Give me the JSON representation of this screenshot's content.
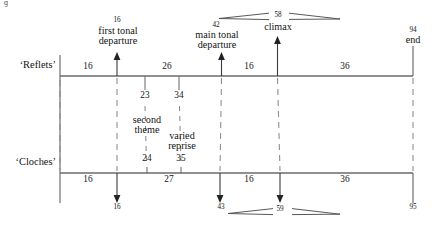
{
  "figure": {
    "type": "timeline-comparison-diagram",
    "tracks": [
      {
        "id": "reflets",
        "label": "‘Reflets’",
        "spans": [
          "16",
          "26",
          "16",
          "36"
        ],
        "ticks": [
          "23",
          "34"
        ],
        "start": "",
        "end": "94",
        "end_label": "end"
      },
      {
        "id": "cloches",
        "label": "‘Cloches’",
        "spans": [
          "16",
          "27",
          "16",
          "36"
        ],
        "ticks": [
          "24",
          "35"
        ],
        "end": "95"
      }
    ],
    "events": [
      {
        "id": "first-tonal-departure",
        "top_number": "16",
        "name": "first tonal\ndeparture",
        "bottom_number": "16"
      },
      {
        "id": "main-tonal-departure",
        "top_number": "42",
        "name": "main tonal\ndeparture",
        "bottom_number": "43"
      },
      {
        "id": "climax",
        "top_number": "58",
        "name": "climax",
        "bottom_number": "59"
      }
    ],
    "inner_labels": [
      {
        "id": "second-theme",
        "text": "second\ntheme",
        "upper_number": "23",
        "lower_number": "24"
      },
      {
        "id": "varied-reprise",
        "text": "varied\nreprise",
        "upper_number": "34",
        "lower_number": "35"
      }
    ],
    "hairpins": {
      "top_pair": true,
      "bottom_pair": true
    },
    "colors": {
      "rule": "#5a5a5a",
      "text": "#131313",
      "dash": "#7a7a7a"
    },
    "stray_glyph": "ɡ"
  }
}
